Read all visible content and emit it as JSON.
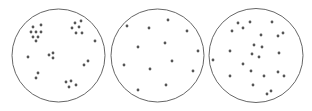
{
  "diagram": {
    "colors": {
      "circle_stroke": "#555555",
      "dot_fill": "#555555",
      "background": "#ffffff"
    },
    "panels": [
      {
        "name": "clustered",
        "circle": {
          "cx": 58.5,
          "cy": 55.5,
          "r": 46.5
        },
        "dots": [
          [
            33,
            27
          ],
          [
            41,
            25
          ],
          [
            31,
            32
          ],
          [
            36,
            32
          ],
          [
            41,
            32
          ],
          [
            33,
            37
          ],
          [
            38,
            37
          ],
          [
            36,
            41
          ],
          [
            81,
            21
          ],
          [
            75,
            23
          ],
          [
            72,
            28
          ],
          [
            79,
            27
          ],
          [
            76,
            33
          ],
          [
            82,
            33
          ],
          [
            95,
            41
          ],
          [
            49,
            55
          ],
          [
            53,
            53
          ],
          [
            53,
            58
          ],
          [
            28,
            57
          ],
          [
            88,
            61
          ],
          [
            84,
            65
          ],
          [
            38,
            73
          ],
          [
            36,
            78
          ],
          [
            66,
            82
          ],
          [
            71,
            81
          ],
          [
            69,
            87
          ],
          [
            76,
            85
          ]
        ]
      },
      {
        "name": "uniform",
        "circle": {
          "cx": 157.5,
          "cy": 55.5,
          "r": 46.5
        },
        "dots": [
          [
            127,
            26
          ],
          [
            149,
            28
          ],
          [
            168,
            20
          ],
          [
            187,
            31
          ],
          [
            138,
            47
          ],
          [
            165,
            43
          ],
          [
            198,
            51
          ],
          [
            172,
            61
          ],
          [
            124,
            65
          ],
          [
            150,
            69
          ],
          [
            193,
            71
          ],
          [
            166,
            85
          ],
          [
            138,
            90
          ]
        ]
      },
      {
        "name": "random",
        "circle": {
          "cx": 256,
          "cy": 55.5,
          "r": 47
        },
        "dots": [
          [
            238,
            23
          ],
          [
            250,
            22
          ],
          [
            243,
            28
          ],
          [
            232,
            31
          ],
          [
            272,
            22
          ],
          [
            283,
            33
          ],
          [
            278,
            36
          ],
          [
            261,
            35
          ],
          [
            254,
            45
          ],
          [
            262,
            47
          ],
          [
            230,
            51
          ],
          [
            252,
            54
          ],
          [
            259,
            57
          ],
          [
            279,
            53
          ],
          [
            213,
            60
          ],
          [
            243,
            64
          ],
          [
            251,
            71
          ],
          [
            278,
            72
          ],
          [
            284,
            76
          ],
          [
            230,
            76
          ],
          [
            264,
            76
          ],
          [
            253,
            85
          ],
          [
            271,
            91
          ],
          [
            267,
            94
          ]
        ]
      }
    ]
  }
}
